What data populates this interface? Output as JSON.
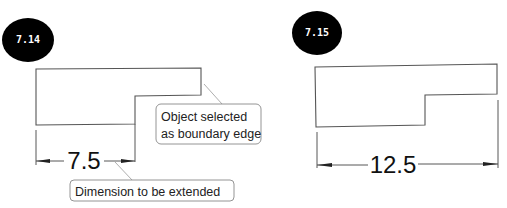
{
  "figures": [
    {
      "id_label": "7.14",
      "dimension_value": "7.5",
      "callouts": [
        {
          "lines": [
            "Object selected",
            "as boundary edge"
          ]
        },
        {
          "lines": [
            "Dimension to be extended"
          ]
        }
      ]
    },
    {
      "id_label": "7.15",
      "dimension_value": "12.5"
    }
  ],
  "colors": {
    "badge": "#000000",
    "badge_text": "#ffffff",
    "line": "#555555"
  }
}
